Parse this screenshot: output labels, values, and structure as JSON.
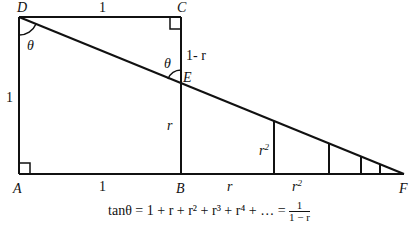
{
  "diagram": {
    "points": {
      "D": {
        "label": "D",
        "x": 19,
        "y": 17
      },
      "C": {
        "label": "C",
        "x": 181,
        "y": 17
      },
      "A": {
        "label": "A",
        "x": 19,
        "y": 174
      },
      "B": {
        "label": "B",
        "x": 181,
        "y": 174
      },
      "E": {
        "label": "E",
        "x": 181,
        "y": 84
      },
      "F": {
        "label": "F",
        "x": 404,
        "y": 174
      }
    },
    "segment_labels": {
      "DC": "1",
      "CE": "1- r",
      "DA": "1",
      "EB": "r",
      "AB": "1",
      "B_to_next": "r",
      "next_to_next": "r",
      "vertical_r2": "r",
      "r2_exp": "2",
      "base_r2_exp": "2"
    },
    "angle_labels": {
      "at_D": "θ",
      "at_E": "θ"
    },
    "small_verticals_x": [
      274,
      329,
      361,
      380
    ]
  },
  "formula": {
    "lhs": "tanθ",
    "series": "= 1 + r + r² + r³ + r⁴ + … =",
    "frac_num": "1",
    "frac_den": "1 − r"
  }
}
